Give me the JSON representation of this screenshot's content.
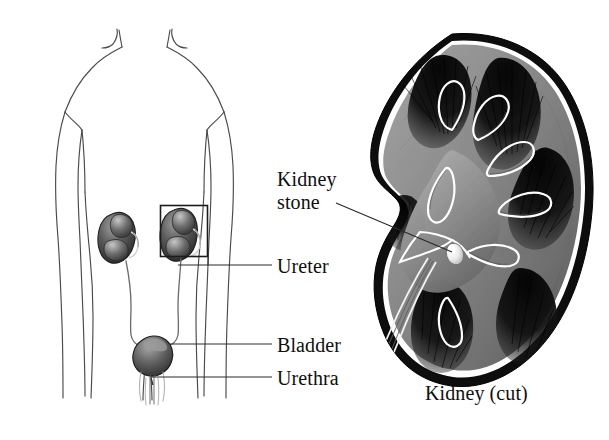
{
  "figure": {
    "background_color": "#ffffff",
    "ink_color": "#100f0f",
    "width": 609,
    "height": 440
  },
  "labels": {
    "kidney_stone": "Kidney\nstone",
    "kidney_stone_line1": "Kidney",
    "kidney_stone_line2": "stone",
    "ureter": "Ureter",
    "bladder": "Bladder",
    "urethra": "Urethra",
    "caption": "Kidney (cut)"
  },
  "diagram_parts": {
    "body_outline": "headless human torso, shoulders to thighs, arms at sides",
    "left_kidney": "bean-shaped dark organ, left side of abdomen",
    "right_kidney": "bean-shaped dark organ enclosed in a rectangular callout box",
    "callout_box": "rectangle around right kidney linking to enlarged cross-section",
    "ureters": "two thin tubes descending from kidneys to bladder",
    "bladder": "dark rounded sac at pelvis",
    "urethra": "thin tube descending below bladder",
    "kidney_cut": "enlarged sagittal cross-section of kidney at right",
    "stone": "small bright white oval in the renal pelvis"
  },
  "colors": {
    "outline": "#3c3c3c",
    "organ_dark": "#3a3a3a",
    "organ_mid": "#777777",
    "organ_light": "#c9c9c9",
    "capsule": "#0d0d0d",
    "cortex": "#8e8e8e",
    "medulla": "#1a1a1a",
    "stone": "#fbfbfb",
    "leader": "#2a2a2a"
  }
}
